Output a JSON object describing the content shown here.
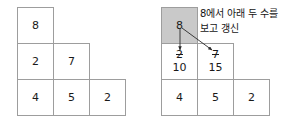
{
  "diagram": {
    "title_text_korean": "8에서 아래 두 수를 보고 갱신",
    "note": {
      "line1": "8에서 아래 두 수를",
      "line2": "보고 갱신"
    },
    "colors": {
      "cell_border": "#9d9d9d",
      "cell_fill": "#ffffff",
      "highlight_fill": "#c9c9c9",
      "text": "#1a1a1a",
      "arrow": "#2a2a2a"
    },
    "panels": [
      {
        "id": "before",
        "name": "before-state",
        "rows": [
          {
            "cells": [
              {
                "value": "8",
                "highlighted": false,
                "old_value": null
              }
            ]
          },
          {
            "cells": [
              {
                "value": "2",
                "highlighted": false,
                "old_value": null
              },
              {
                "value": "7",
                "highlighted": false,
                "old_value": null
              }
            ]
          },
          {
            "cells": [
              {
                "value": "4",
                "highlighted": false,
                "old_value": null
              },
              {
                "value": "5",
                "highlighted": false,
                "old_value": null
              },
              {
                "value": "2",
                "highlighted": false,
                "old_value": null
              }
            ]
          }
        ]
      },
      {
        "id": "after",
        "name": "after-state",
        "rows": [
          {
            "cells": [
              {
                "value": "8",
                "highlighted": true,
                "old_value": null
              }
            ]
          },
          {
            "cells": [
              {
                "value": "10",
                "highlighted": false,
                "old_value": "2"
              },
              {
                "value": "15",
                "highlighted": false,
                "old_value": "7"
              }
            ]
          },
          {
            "cells": [
              {
                "value": "4",
                "highlighted": false,
                "old_value": null
              },
              {
                "value": "5",
                "highlighted": false,
                "old_value": null
              },
              {
                "value": "2",
                "highlighted": false,
                "old_value": null
              }
            ]
          }
        ]
      }
    ],
    "arrows": [
      {
        "name": "arrow-8-to-left-child",
        "from": [
          180,
          30
        ],
        "to": [
          180,
          48
        ]
      },
      {
        "name": "arrow-8-to-right-child",
        "from": [
          182,
          30
        ],
        "to": [
          211,
          50
        ]
      }
    ]
  }
}
